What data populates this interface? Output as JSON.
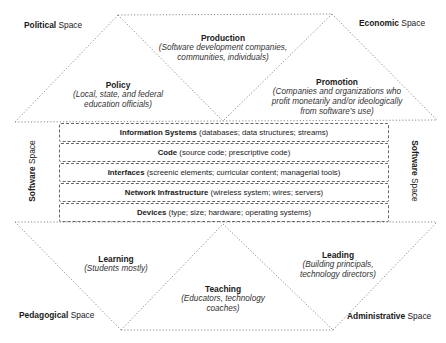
{
  "spaces": {
    "political": {
      "bold": "Political",
      "rest": " Space"
    },
    "economic": {
      "bold": "Economic",
      "rest": " Space"
    },
    "software_left": {
      "bold": "Software",
      "rest": " Space"
    },
    "software_right": {
      "bold": "Software",
      "rest": " Space"
    },
    "pedagogical": {
      "bold": "Pedagogical",
      "rest": " Space"
    },
    "administrative": {
      "bold": "Administrative",
      "rest": " Space"
    }
  },
  "nodes": {
    "production": {
      "title": "Production",
      "sub1": "(Software development companies,",
      "sub2": "communities, individuals)"
    },
    "policy": {
      "title": "Policy",
      "sub1": "(Local, state, and federal",
      "sub2": "education officials)"
    },
    "promotion": {
      "title": "Promotion",
      "sub1": "(Companies and organizations who",
      "sub2": "profit monetarily and/or ideologically",
      "sub3": "from software's use)"
    },
    "learning": {
      "title": "Learning",
      "sub1": "(Students mostly)"
    },
    "teaching": {
      "title": "Teaching",
      "sub1": "(Educators, technology",
      "sub2": "coaches)"
    },
    "leading": {
      "title": "Leading",
      "sub1": "(Building principals,",
      "sub2": "technology directors)"
    }
  },
  "software_layers": [
    {
      "name": "Information Systems",
      "detail": " (databases; data structures; streams)"
    },
    {
      "name": "Code",
      "detail": " (source code; prescriptive code)"
    },
    {
      "name": "Interfaces",
      "detail": " (screenic elements; curricular content; managerial tools)"
    },
    {
      "name": "Network Infrastructure",
      "detail": " (wireless system; wires; servers)"
    },
    {
      "name": "Devices",
      "detail": " (type; size; hardware; operating systems)"
    }
  ],
  "colors": {
    "line": "#777777",
    "text": "#1a1a1a"
  }
}
